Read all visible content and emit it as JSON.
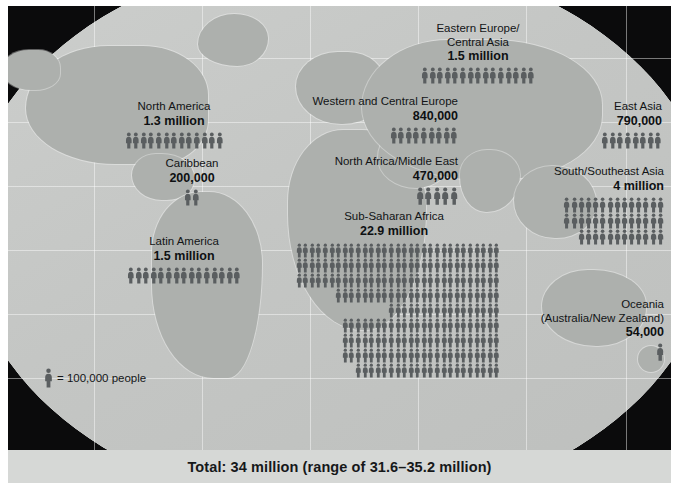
{
  "title_bar": {
    "total_text": "Total: 34 million (range of 31.6–35.2 million)"
  },
  "legend": {
    "symbol": "person-figure-icon",
    "text": "= 100,000 people",
    "unit_value": 100000
  },
  "colors": {
    "background": "#0b0b0c",
    "ocean": "#c9cbc9",
    "land": "#adb0ad",
    "figure": "#5a5e60",
    "text": "#121416",
    "total_bar": "#d6d8d6",
    "page": "#ffffff"
  },
  "regions": [
    {
      "id": "eastern-europe-central-asia",
      "name_lines": [
        "Eastern Europe/",
        "Central Asia"
      ],
      "value_label": "1.5 million",
      "figures": 15,
      "rows": [
        15
      ]
    },
    {
      "id": "north-america",
      "name_lines": [
        "North America"
      ],
      "value_label": "1.3 million",
      "figures": 13,
      "rows": [
        13
      ]
    },
    {
      "id": "caribbean",
      "name_lines": [
        "Caribbean"
      ],
      "value_label": "200,000",
      "figures": 2,
      "rows": [
        2
      ]
    },
    {
      "id": "latin-america",
      "name_lines": [
        "Latin America"
      ],
      "value_label": "1.5 million",
      "figures": 15,
      "rows": [
        15
      ]
    },
    {
      "id": "western-and-central-europe",
      "name_lines": [
        "Western and Central Europe"
      ],
      "value_label": "840,000",
      "figures": 9,
      "rows": [
        9
      ]
    },
    {
      "id": "north-africa-middle-east",
      "name_lines": [
        "North Africa/Middle East"
      ],
      "value_label": "470,000",
      "figures": 5,
      "rows": [
        5
      ]
    },
    {
      "id": "sub-saharan-africa",
      "name_lines": [
        "Sub-Saharan Africa"
      ],
      "value_label": "22.9 million",
      "figures": 229,
      "rows": [
        31,
        31,
        31,
        25,
        17,
        24,
        24,
        24,
        22
      ]
    },
    {
      "id": "east-asia",
      "name_lines": [
        "East Asia"
      ],
      "value_label": "790,000",
      "figures": 8,
      "rows": [
        8
      ]
    },
    {
      "id": "south-southeast-asia",
      "name_lines": [
        "South/Southeast Asia"
      ],
      "value_label": "4 million",
      "figures": 40,
      "rows": [
        14,
        14,
        12
      ]
    },
    {
      "id": "oceania",
      "name_lines": [
        "Oceania",
        "(Australia/New Zealand)"
      ],
      "value_label": "54,000",
      "figures": 1,
      "rows": [
        1
      ]
    }
  ]
}
